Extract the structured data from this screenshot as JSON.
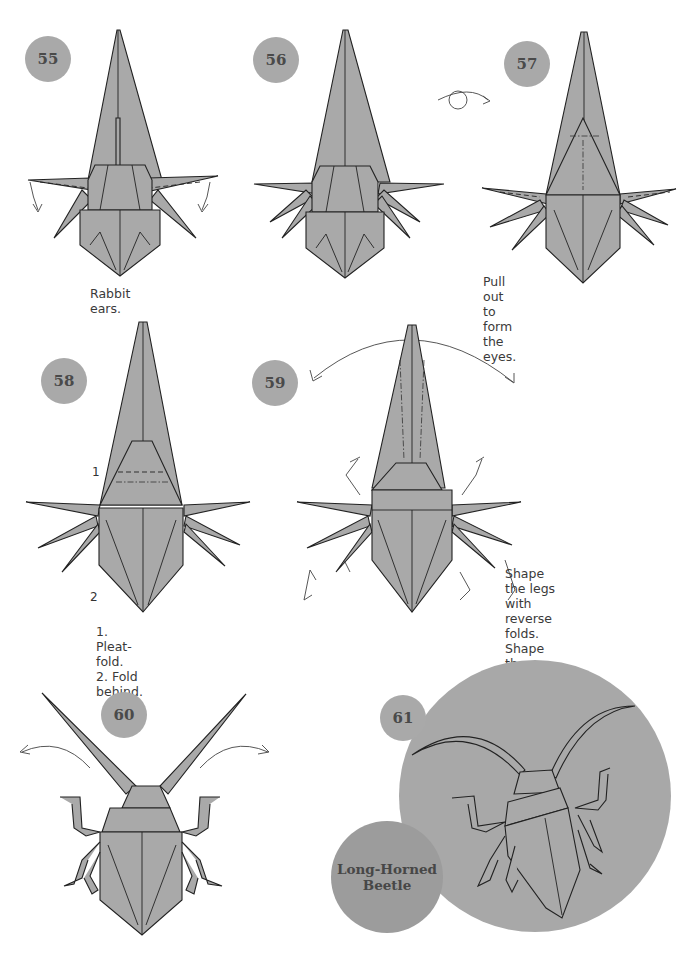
{
  "page": {
    "colors": {
      "paper": "#a9a9a9",
      "badge": "#a9a9a9",
      "line": "#222222",
      "background": "#ffffff"
    }
  },
  "steps": [
    {
      "number": "55",
      "caption": "Rabbit ears."
    },
    {
      "number": "56",
      "caption": ""
    },
    {
      "number": "57",
      "caption": "Pull out to\nform the eyes.",
      "symbol": "turn-over-icon"
    },
    {
      "number": "58",
      "caption": "1. Pleat-fold.\n2. Fold behind.",
      "labels": [
        "1",
        "2"
      ]
    },
    {
      "number": "59",
      "caption": "Shape the legs with reverse\nfolds. Shape the antennae\nwith double rabbit ears."
    },
    {
      "number": "60",
      "caption": ""
    },
    {
      "number": "61",
      "caption": ""
    }
  ],
  "title": {
    "line1": "Long-Horned",
    "line2": "Beetle"
  }
}
